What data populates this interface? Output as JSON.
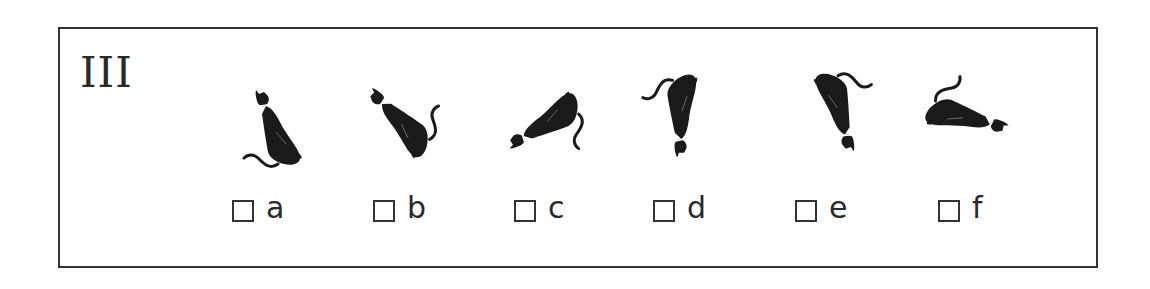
{
  "exercise": {
    "number": "III",
    "figures": [
      {
        "id": "a",
        "icon": "cat-silhouette-icon",
        "rotation_deg": 0,
        "flip": false
      },
      {
        "id": "b",
        "icon": "cat-silhouette-icon",
        "rotation_deg": -60,
        "flip": true
      },
      {
        "id": "c",
        "icon": "cat-silhouette-icon",
        "rotation_deg": 95,
        "flip": false
      },
      {
        "id": "d",
        "icon": "cat-silhouette-icon",
        "rotation_deg": 160,
        "flip": true
      },
      {
        "id": "e",
        "icon": "cat-silhouette-icon",
        "rotation_deg": 180,
        "flip": false
      },
      {
        "id": "f",
        "icon": "cat-silhouette-icon",
        "rotation_deg": 120,
        "flip": false
      }
    ],
    "options": [
      {
        "label": "a",
        "checked": false
      },
      {
        "label": "b",
        "checked": false
      },
      {
        "label": "c",
        "checked": false
      },
      {
        "label": "d",
        "checked": false
      },
      {
        "label": "e",
        "checked": false
      },
      {
        "label": "f",
        "checked": false
      }
    ]
  }
}
